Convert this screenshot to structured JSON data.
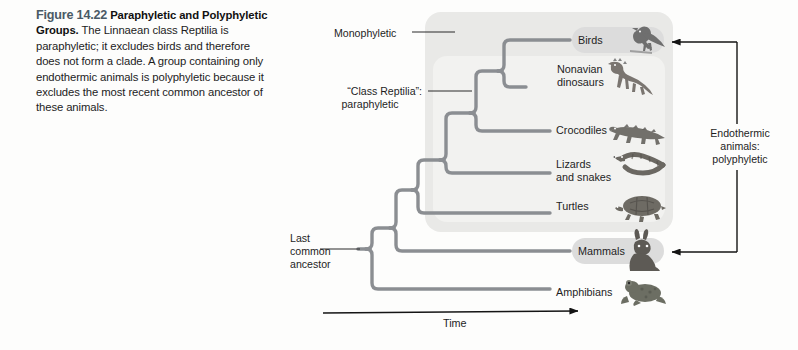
{
  "caption": {
    "figure_number": "Figure 14.22",
    "title": "Paraphyletic and Polyphyletic Groups.",
    "body": "The Linnaean class Reptilia is paraphyletic; it excludes birds and therefore does not form a clade. A group containing only endothermic animals is polyphyletic because it excludes the most recent common ancestor of these animals."
  },
  "annotations": {
    "monophyletic": "Monophyletic",
    "class_reptilia_line1": "“Class Reptilia”:",
    "class_reptilia_line2": "paraphyletic",
    "last_common_ancestor": "Last\ncommon\nancestor",
    "endothermic": "Endothermic\nanimals:\npolyphyletic",
    "time_axis": "Time"
  },
  "taxa": [
    {
      "id": "birds",
      "label": "Birds",
      "highlighted": true,
      "extinct": false
    },
    {
      "id": "dinosaurs",
      "label": "Nonavian\ndinosaurs",
      "highlighted": false,
      "extinct": true
    },
    {
      "id": "crocodiles",
      "label": "Crocodiles",
      "highlighted": false,
      "extinct": false
    },
    {
      "id": "lizards",
      "label": "Lizards\nand snakes",
      "highlighted": false,
      "extinct": false
    },
    {
      "id": "turtles",
      "label": "Turtles",
      "highlighted": false,
      "extinct": false
    },
    {
      "id": "mammals",
      "label": "Mammals",
      "highlighted": true,
      "extinct": false
    },
    {
      "id": "amphibians",
      "label": "Amphibians",
      "highlighted": false,
      "extinct": false
    }
  ],
  "colors": {
    "branch": "#8b8e92",
    "monophyletic_box": "#e9e9e7",
    "paraphyletic_box": "#efefed",
    "highlight_pill": "#dcdcdc",
    "arrow": "#141414",
    "text": "#1e1e1e",
    "figure_number": "#4a5a66"
  }
}
